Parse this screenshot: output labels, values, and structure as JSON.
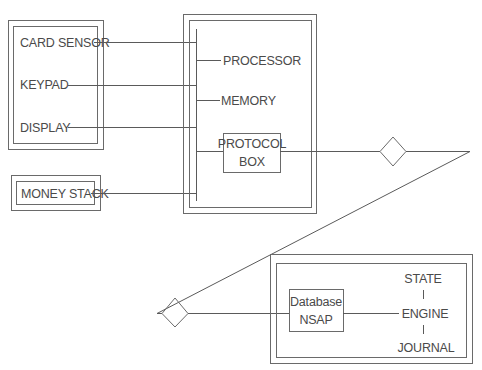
{
  "diagram": {
    "terminal": {
      "components": [
        {
          "label": "CARD SENSOR"
        },
        {
          "label": "KEYPAD"
        },
        {
          "label": "DISPLAY"
        }
      ]
    },
    "money_stack": {
      "label": "MONEY STACK"
    },
    "controller": {
      "items": [
        {
          "label": "PROCESSOR"
        },
        {
          "label": "MEMORY"
        }
      ],
      "protocol_box": {
        "line1": "PROTOCOL",
        "line2": "BOX"
      }
    },
    "host": {
      "database_box": {
        "line1": "Database",
        "line2": "NSAP"
      },
      "stack": [
        {
          "label": "STATE"
        },
        {
          "label": "ENGINE"
        },
        {
          "label": "JOURNAL"
        }
      ]
    },
    "connectors": [
      "upper-diamond",
      "lower-diamond"
    ],
    "colors": {
      "line": "#5a5a5a",
      "text": "#4a4a4a",
      "background": "#ffffff"
    }
  }
}
